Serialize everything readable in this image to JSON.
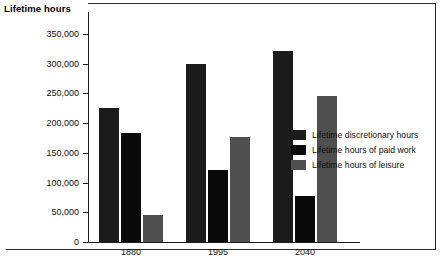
{
  "chart_data": {
    "type": "bar",
    "title": "",
    "ylabel": "Lifetime hours",
    "xlabel": "",
    "categories": [
      "1880",
      "1995",
      "2040"
    ],
    "series": [
      {
        "name": "Lifetime discretionary hours",
        "color": "#1b1b1b",
        "values": [
          225000,
          300000,
          322000
        ]
      },
      {
        "name": "Lifetime hours of paid work",
        "color": "#0a0a0a",
        "values": [
          184000,
          122000,
          77000
        ]
      },
      {
        "name": "Lifetime hours of leisure",
        "color": "#4f4f4f",
        "values": [
          45000,
          176000,
          245000
        ]
      }
    ],
    "ylim": [
      0,
      350000
    ],
    "yticks": [
      0,
      50000,
      100000,
      150000,
      200000,
      250000,
      300000,
      350000
    ],
    "ytick_labels": [
      "0",
      "50,000",
      "100,000",
      "150,000",
      "200,000",
      "250,000",
      "300,000",
      "350,000"
    ],
    "grid": false,
    "legend_position": "inside-right"
  },
  "axis": {
    "title": "Lifetime hours"
  },
  "legend": {
    "items": [
      {
        "label": "Lifetime discretionary hours",
        "color": "#1b1b1b"
      },
      {
        "label": "Lifetime hours of paid work",
        "color": "#0a0a0a"
      },
      {
        "label": "Lifetime hours of leisure",
        "color": "#4f4f4f"
      }
    ]
  }
}
